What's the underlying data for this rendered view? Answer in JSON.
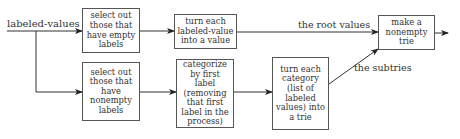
{
  "input_label": "labeled-values",
  "boxes": {
    "select_empty": "select out those that have empty labels",
    "select_nonempty": "select out those that have nonempty labels",
    "turn_value": "turn each labeled-value into a value",
    "categorize": "categorize by first label (removing that first label in the process)",
    "turn_trie": "turn each category (list of labeled values) into a trie",
    "make_trie": "make a nonempty trie"
  },
  "edge_labels": {
    "root_values": "the root values",
    "subtries": "the subtries"
  },
  "colors": {
    "line": "#333333",
    "border": "#555555",
    "background": "#ffffff"
  }
}
